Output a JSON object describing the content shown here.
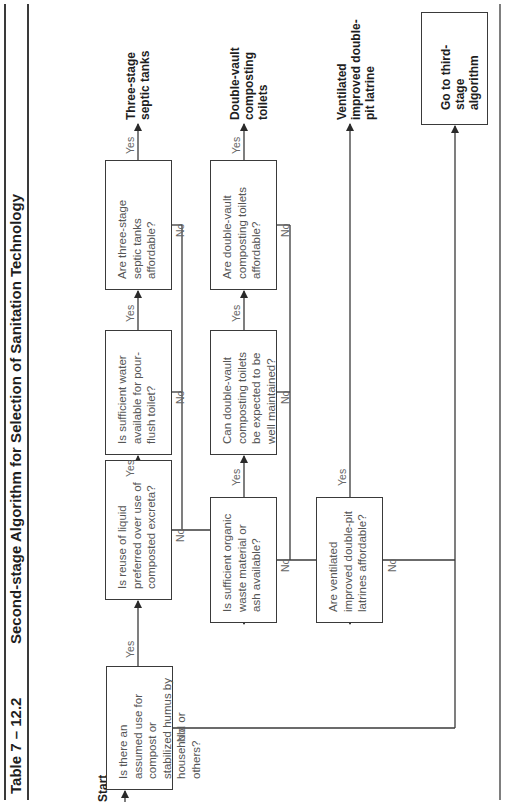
{
  "header": {
    "table_number": "Table 7 – 12.2",
    "title": "Second-stage Algorithm for Selection of Sanitation Technology"
  },
  "start_label": "Start",
  "decisions": [
    {
      "id": "q1",
      "text": "Is there an assumed use for compost or stabilized humus by household or others?"
    },
    {
      "id": "q2",
      "text": "Is reuse of liquid preferred over use of composted excreta?"
    },
    {
      "id": "q3",
      "text": "Is sufficient water available for pour-flush toilet?"
    },
    {
      "id": "q4",
      "text": "Are three-stage septic tanks affordable?"
    },
    {
      "id": "q5",
      "text": "Is sufficient organic waste material or ash available?"
    },
    {
      "id": "q6",
      "text": "Can double-vault composting toilets be expected to be well maintained?"
    },
    {
      "id": "q7",
      "text": "Are double-vault composting toilets affordable?"
    },
    {
      "id": "q8",
      "text": "Are ventilated improved double-pit latrines affordable?"
    }
  ],
  "outcomes": [
    {
      "id": "o1",
      "text": "Three-stage septic tanks"
    },
    {
      "id": "o2",
      "text": "Double-vault composting toilets"
    },
    {
      "id": "o3",
      "text": "Ventilated improved double-pit latrine"
    },
    {
      "id": "o4",
      "text": "Go to third-stage algorithm"
    }
  ],
  "edge_labels": {
    "yes": "Yes",
    "no": "No"
  },
  "colors": {
    "line": "#3a3a3a",
    "text": "#555555",
    "bold_text": "#1e1e1e"
  }
}
